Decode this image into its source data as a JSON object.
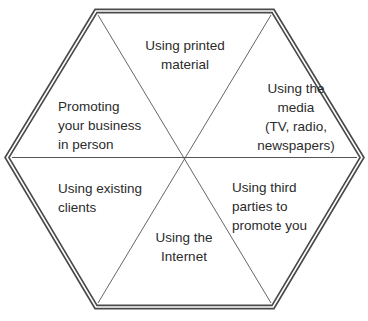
{
  "diagram": {
    "type": "hexagon-segmented",
    "colors": {
      "outline": "#4a4a4a",
      "divider": "#555555",
      "text": "#2b2b2b",
      "background": "#ffffff"
    },
    "segments": [
      {
        "id": "top",
        "label": "Using printed\nmaterial"
      },
      {
        "id": "top-right",
        "label": "Using the\nmedia\n(TV, radio,\nnewspapers)"
      },
      {
        "id": "bottom-right",
        "label": "Using third\nparties to\npromote you"
      },
      {
        "id": "bottom",
        "label": "Using the\nInternet"
      },
      {
        "id": "bottom-left",
        "label": "Using existing\nclients"
      },
      {
        "id": "top-left",
        "label": "Promoting\nyour business\nin person"
      }
    ]
  }
}
